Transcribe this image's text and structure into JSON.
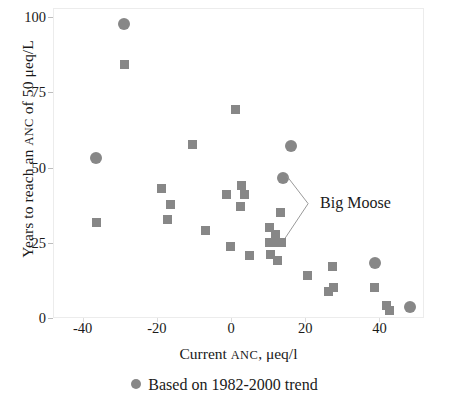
{
  "chart_data": {
    "type": "scatter",
    "title": "",
    "xlabel": "Current ANC, μeq/l",
    "ylabel": "Years to reach an ANC of 50 μeq/L",
    "xlim": [
      -48,
      52
    ],
    "ylim": [
      0,
      103
    ],
    "grid": false,
    "legend_position": "bottom-center",
    "xticks": [
      -40,
      -20,
      0,
      20,
      40
    ],
    "xtick_labels": [
      "-40",
      "-20",
      "0",
      "20",
      "40"
    ],
    "yticks": [
      0,
      25,
      50,
      75,
      100
    ],
    "ytick_labels": [
      "0",
      "25",
      "50",
      "75",
      "100"
    ],
    "marker_color": "#878787",
    "series": [
      {
        "name": "Based on 1982-2000 trend",
        "marker": "circle",
        "points": [
          {
            "x": -29.0,
            "y": 98.0
          },
          {
            "x": -36.8,
            "y": 53.5
          },
          {
            "x": 16.0,
            "y": 57.5
          },
          {
            "x": 13.8,
            "y": 47.0
          },
          {
            "x": 38.5,
            "y": 18.5
          },
          {
            "x": 48.0,
            "y": 4.0
          }
        ]
      },
      {
        "name": "Other sites",
        "marker": "square",
        "points": [
          {
            "x": -29.0,
            "y": 84.5
          },
          {
            "x": -36.5,
            "y": 32.0
          },
          {
            "x": -19.0,
            "y": 43.5
          },
          {
            "x": -16.5,
            "y": 38.0
          },
          {
            "x": -17.5,
            "y": 33.0
          },
          {
            "x": -10.8,
            "y": 58.0
          },
          {
            "x": -7.2,
            "y": 29.5
          },
          {
            "x": -1.5,
            "y": 41.5
          },
          {
            "x": -0.3,
            "y": 24.0
          },
          {
            "x": 0.8,
            "y": 69.5
          },
          {
            "x": 2.5,
            "y": 44.5
          },
          {
            "x": 3.4,
            "y": 41.5
          },
          {
            "x": 2.4,
            "y": 37.5
          },
          {
            "x": 4.6,
            "y": 21.0
          },
          {
            "x": 10.0,
            "y": 30.5
          },
          {
            "x": 10.2,
            "y": 25.5
          },
          {
            "x": 10.3,
            "y": 21.5
          },
          {
            "x": 11.6,
            "y": 28.0
          },
          {
            "x": 11.8,
            "y": 25.5
          },
          {
            "x": 12.2,
            "y": 19.5
          },
          {
            "x": 13.2,
            "y": 25.5
          },
          {
            "x": 13.0,
            "y": 35.5
          },
          {
            "x": 20.3,
            "y": 14.5
          },
          {
            "x": 26.0,
            "y": 9.0
          },
          {
            "x": 27.2,
            "y": 17.5
          },
          {
            "x": 27.4,
            "y": 10.5
          },
          {
            "x": 38.3,
            "y": 10.5
          },
          {
            "x": 41.5,
            "y": 4.5
          },
          {
            "x": 42.5,
            "y": 2.8
          }
        ]
      }
    ],
    "annotations": [
      {
        "text": "Big Moose",
        "label_x": 24.0,
        "label_y": 38.0,
        "targets": [
          {
            "x": 13.8,
            "y": 47.0
          },
          {
            "x": 13.2,
            "y": 26.5
          }
        ]
      }
    ],
    "legend": [
      {
        "label": "Based on 1982-2000 trend",
        "marker": "circle",
        "color": "#878787"
      }
    ]
  },
  "axes": {
    "y_label_parts": {
      "pre": "Years to reach an ",
      "caps": "ANC",
      "post": " of 50 μeq/L"
    },
    "x_label_parts": {
      "pre": "Current ",
      "caps": "ANC",
      "post": ", μeq/l"
    }
  },
  "annotation": {
    "big_moose": "Big Moose"
  },
  "legend": {
    "entry_label": "Based on 1982-2000 trend"
  },
  "ticks": {
    "y": [
      "100",
      "75",
      "50",
      "25",
      "0"
    ],
    "x": [
      "-40",
      "-20",
      "0",
      "20",
      "40"
    ]
  }
}
